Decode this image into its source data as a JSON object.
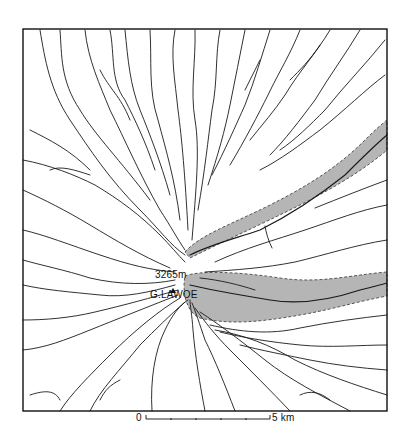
{
  "map": {
    "summit_elevation": "3265m",
    "summit_name": "G.LAWOE",
    "scale_bar": {
      "start_label": "0",
      "end_label": "5 km",
      "divisions": 5
    },
    "colors": {
      "stream": "#1a1a1a",
      "frame": "#111111",
      "shaded_valley": "#b3b3b3",
      "valley_outline": "#555555",
      "background": "#ffffff"
    },
    "legend_features": [
      "radial drainage streams",
      "shaded valley zones (dashed outline)",
      "summit marker"
    ]
  }
}
